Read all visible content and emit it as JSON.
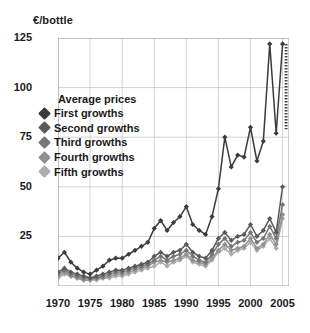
{
  "chart_data": {
    "type": "line",
    "title": "",
    "ylabel": "€/bottle",
    "xlabel": "",
    "ylim": [
      0,
      125
    ],
    "xlim": [
      1970,
      2006
    ],
    "yticks": [
      0,
      25,
      50,
      75,
      100,
      125
    ],
    "ytick_labels": [
      "0",
      "25",
      "50",
      "75",
      "100",
      "125"
    ],
    "xticks": [
      1970,
      1975,
      1980,
      1985,
      1990,
      1995,
      2000,
      2005
    ],
    "xtick_labels": [
      "1970",
      "1975",
      "1980",
      "1985",
      "1990",
      "1995",
      "2000",
      "2005"
    ],
    "grid": true,
    "legend_position": "upper-left-inside",
    "legend_title": "Average prices",
    "x": [
      1970,
      1971,
      1972,
      1973,
      1974,
      1975,
      1976,
      1977,
      1978,
      1979,
      1980,
      1981,
      1982,
      1983,
      1984,
      1985,
      1986,
      1987,
      1988,
      1989,
      1990,
      1991,
      1992,
      1993,
      1994,
      1995,
      1996,
      1997,
      1998,
      1999,
      2000,
      2001,
      2002,
      2003,
      2004,
      2005
    ],
    "series": [
      {
        "name": "First growths",
        "color": "#3b3b3b",
        "values": [
          14,
          17,
          12,
          9,
          7,
          6,
          8,
          10,
          13,
          14,
          14,
          16,
          18,
          20,
          22,
          29,
          33,
          28,
          32,
          35,
          40,
          31,
          28,
          26,
          35,
          49,
          75,
          60,
          66,
          65,
          80,
          63,
          73,
          122,
          77,
          122
        ]
      },
      {
        "name": "Second growths",
        "color": "#595959",
        "values": [
          7,
          9,
          7,
          6,
          5,
          4,
          5,
          6,
          7,
          8,
          8,
          9,
          10,
          11,
          12,
          15,
          17,
          15,
          17,
          18,
          21,
          17,
          15,
          14,
          18,
          24,
          27,
          23,
          25,
          26,
          31,
          25,
          28,
          34,
          27,
          50
        ]
      },
      {
        "name": "Third growths",
        "color": "#767676",
        "values": [
          6,
          8,
          6,
          5,
          4,
          4,
          4,
          5,
          6,
          7,
          7,
          8,
          9,
          10,
          11,
          13,
          15,
          13,
          15,
          16,
          18,
          15,
          13,
          12,
          16,
          21,
          24,
          20,
          22,
          23,
          27,
          22,
          24,
          30,
          24,
          41
        ]
      },
      {
        "name": "Fourth growths",
        "color": "#919191",
        "values": [
          5,
          7,
          5,
          4,
          3,
          3,
          4,
          4,
          5,
          6,
          6,
          7,
          8,
          9,
          10,
          12,
          13,
          12,
          13,
          14,
          16,
          13,
          12,
          11,
          14,
          18,
          21,
          18,
          19,
          20,
          24,
          19,
          21,
          26,
          21,
          36
        ]
      },
      {
        "name": "Fifth growths",
        "color": "#adadad",
        "values": [
          4,
          6,
          5,
          4,
          3,
          3,
          3,
          4,
          4,
          5,
          5,
          6,
          7,
          8,
          9,
          10,
          12,
          10,
          12,
          13,
          15,
          12,
          11,
          10,
          13,
          17,
          19,
          16,
          18,
          19,
          22,
          18,
          20,
          24,
          19,
          34
        ]
      }
    ],
    "annotation_segment": {
      "name": "projected-first-growth-2005",
      "style": "dashed",
      "x": 2005,
      "y_from": 122,
      "y_to": 79
    }
  }
}
